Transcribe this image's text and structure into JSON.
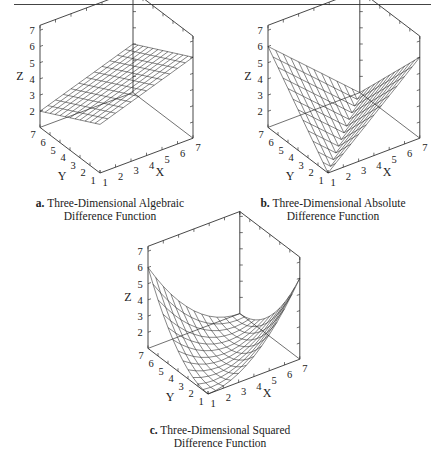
{
  "figures": [
    {
      "id": "a",
      "letter": "a.",
      "caption_line1": "Three-Dimensional Algebraic",
      "caption_line2": "Difference Function",
      "function": "algebraic",
      "origin": [
        100,
        173
      ],
      "x_unit": [
        15.5,
        -5.8
      ],
      "y_unit": [
        -10.0,
        -7.6
      ],
      "z_unit": 16.2,
      "box_origin": [
        0,
        0
      ],
      "caption_pos": [
        10,
        197,
        200
      ]
    },
    {
      "id": "b",
      "letter": "b.",
      "caption_line1": "Three-Dimensional Absolute",
      "caption_line2": "Difference Function",
      "function": "absolute",
      "origin": [
        328,
        173
      ],
      "x_unit": [
        15.3,
        -5.8
      ],
      "y_unit": [
        -10.0,
        -7.6
      ],
      "z_unit": 16.2,
      "box_origin": [
        0,
        0
      ],
      "caption_pos": [
        233,
        197,
        200
      ]
    },
    {
      "id": "c",
      "letter": "c.",
      "caption_line1": "Three-Dimensional Squared",
      "caption_line2": "Difference Function",
      "function": "squared",
      "origin": [
        208,
        394
      ],
      "x_unit": [
        15.3,
        -5.8
      ],
      "y_unit": [
        -10.0,
        -7.6
      ],
      "z_unit": 16.2,
      "box_origin": [
        0,
        0
      ],
      "caption_pos": [
        120,
        424,
        200
      ]
    }
  ],
  "axes": {
    "x_label": "X",
    "y_label": "Y",
    "z_label": "Z",
    "x_ticks": [
      "1",
      "2",
      "3",
      "4",
      "5",
      "6",
      "7"
    ],
    "y_ticks": [
      "1",
      "2",
      "3",
      "4",
      "5",
      "6",
      "7"
    ],
    "z_ticks": [
      "2",
      "3",
      "4",
      "5",
      "6",
      "7"
    ],
    "range": [
      1,
      7
    ]
  },
  "chart_data": [
    {
      "type": "surface3d",
      "title": "a. Three-Dimensional Algebraic Difference Function",
      "xlabel": "X",
      "ylabel": "Y",
      "zlabel": "Z",
      "xlim": [
        1,
        7
      ],
      "ylim": [
        1,
        7
      ],
      "zlim": [
        1,
        7
      ],
      "formula": "Z = 4 + (X - Y)/3 (planar; Z=2 at X=1,Y=7 ... Z=6 at X=7,Y=1 approx.)",
      "corners": {
        "x1y1": 4,
        "x7y1": 5.6,
        "x1y7": 2,
        "x7y7": 4
      }
    },
    {
      "type": "surface3d",
      "title": "b. Three-Dimensional Absolute Difference Function",
      "xlabel": "X",
      "ylabel": "Y",
      "zlabel": "Z",
      "xlim": [
        1,
        7
      ],
      "ylim": [
        1,
        7
      ],
      "zlim": [
        1,
        7
      ],
      "formula": "Z ∝ |X - Y| (V-shaped; min along X=Y, max ≈6 at far corners)",
      "corners": {
        "x1y1": 1,
        "x7y1": 5.6,
        "x1y7": 6,
        "x7y7": 1
      }
    },
    {
      "type": "surface3d",
      "title": "c. Three-Dimensional Squared Difference Function",
      "xlabel": "X",
      "ylabel": "Y",
      "zlabel": "Z",
      "xlim": [
        1,
        7
      ],
      "ylim": [
        1,
        7
      ],
      "zlim": [
        1,
        7
      ],
      "formula": "Z ∝ (X - Y)^2 (parabolic trough; min along X=Y, max ≈6 at far corners)",
      "corners": {
        "x1y1": 1,
        "x7y1": 5.6,
        "x1y7": 6,
        "x7y7": 1
      }
    }
  ]
}
